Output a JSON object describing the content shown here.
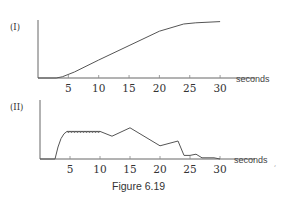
{
  "figure": {
    "caption": "Figure 6.19"
  },
  "chart_data": [
    {
      "type": "line",
      "panel_label": "(I)",
      "title": "",
      "xlabel": "seconds",
      "ylabel": "",
      "xlim": [
        0,
        30
      ],
      "x_ticks": [
        5,
        10,
        15,
        20,
        25,
        30
      ],
      "x_tick_labels": [
        "5",
        "10",
        "15",
        "20",
        "25",
        "30"
      ],
      "grid": false,
      "y_ticks": [],
      "x": [
        0,
        3,
        4,
        6,
        10,
        15,
        20,
        24,
        26,
        30
      ],
      "values": [
        0,
        0,
        1,
        5,
        15,
        27,
        39,
        45,
        46,
        47
      ],
      "y_units": "relative (no scale shown)"
    },
    {
      "type": "line",
      "panel_label": "(II)",
      "title": "",
      "xlabel": "seconds",
      "ylabel": "",
      "xlim": [
        0,
        30
      ],
      "x_ticks": [
        5,
        10,
        15,
        20,
        25,
        30
      ],
      "x_tick_labels": [
        "5",
        "10",
        "15",
        "20",
        "25",
        "30"
      ],
      "grid": false,
      "y_ticks": [],
      "x": [
        0,
        2.5,
        3,
        3.5,
        4,
        4.5,
        10,
        12,
        15,
        20,
        23,
        24,
        25,
        26,
        27,
        29,
        30
      ],
      "values": [
        0,
        0,
        10,
        17,
        21,
        23,
        23,
        19,
        26,
        11,
        15,
        3,
        3,
        4,
        1,
        1,
        0
      ],
      "annotations": [
        "small oscillation (wavy plateau) between ~4.5 s and ~10 s"
      ],
      "y_units": "relative (no scale shown)"
    }
  ]
}
